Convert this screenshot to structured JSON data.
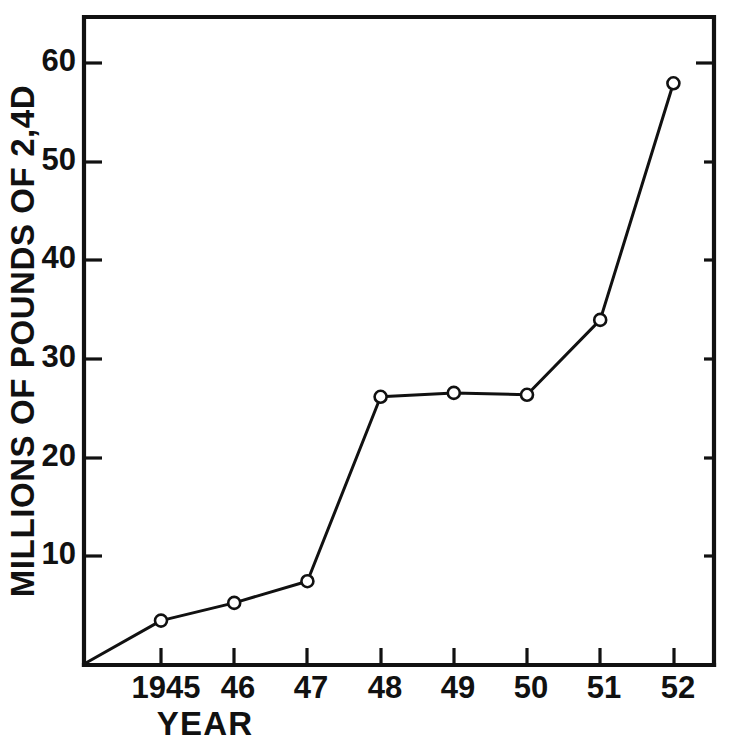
{
  "figure": {
    "background_color": "#ffffff",
    "ink_color": "#111111"
  },
  "chart_data": {
    "type": "line",
    "title": "",
    "subtitle": "",
    "xlabel": "YEAR",
    "ylabel": "MILLIONS OF POUNDS OF 2,4D",
    "x": [
      1945,
      1946,
      1947,
      1948,
      1949,
      1950,
      1951,
      1952
    ],
    "categories": [
      "1945",
      "46",
      "47",
      "48",
      "49",
      "50",
      "51",
      "52"
    ],
    "values": [
      4.5,
      6.3,
      8.5,
      27.2,
      27.6,
      27.4,
      35.0,
      59.0
    ],
    "series": [
      {
        "name": "2,4D production",
        "values": [
          4.5,
          6.3,
          8.5,
          27.2,
          27.6,
          27.4,
          35.0,
          59.0
        ]
      }
    ],
    "xlim": [
      1944.6,
      1952.6
    ],
    "ylim": [
      0,
      66
    ],
    "ytick_values": [
      10,
      20,
      30,
      40,
      50,
      60
    ],
    "ytick_labels": [
      "10",
      "20",
      "30",
      "40",
      "50",
      "60"
    ],
    "xtick_values": [
      1945,
      1946,
      1947,
      1948,
      1949,
      1950,
      1951,
      1952
    ],
    "xtick_labels": [
      "1945",
      "46",
      "47",
      "48",
      "49",
      "50",
      "51",
      "52"
    ],
    "grid": false,
    "legend": null,
    "legend_position": "none",
    "marker": "open-circle",
    "line_style": "solid",
    "annotations": [],
    "origin_note": "line originates at plot origin (0 value, left axis)"
  },
  "axis_labels": {
    "y_title": "MILLIONS OF POUNDS OF 2,4D",
    "x_title": "YEAR"
  },
  "ticks": {
    "y": [
      {
        "label": "60",
        "value": 60
      },
      {
        "label": "50",
        "value": 50
      },
      {
        "label": "40",
        "value": 40
      },
      {
        "label": "30",
        "value": 30
      },
      {
        "label": "20",
        "value": 20
      },
      {
        "label": "10",
        "value": 10
      }
    ],
    "x": [
      {
        "label": "1945",
        "value": 1945
      },
      {
        "label": "46",
        "value": 1946
      },
      {
        "label": "47",
        "value": 1947
      },
      {
        "label": "48",
        "value": 1948
      },
      {
        "label": "49",
        "value": 1949
      },
      {
        "label": "50",
        "value": 1950
      },
      {
        "label": "51",
        "value": 1951
      },
      {
        "label": "52",
        "value": 1952
      }
    ]
  }
}
